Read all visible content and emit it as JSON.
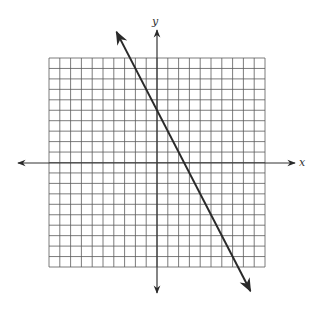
{
  "chart_data": {
    "type": "line",
    "title": "",
    "xlabel": "x",
    "ylabel": "y",
    "xlim": [
      -10,
      10
    ],
    "ylim": [
      -10,
      10
    ],
    "grid": true,
    "grid_step": 1,
    "legend": null,
    "series": [
      {
        "name": "line",
        "equation": "y = -2x + 5",
        "slope": -2,
        "intercept": 5,
        "x": [
          -2.5,
          0,
          2.5,
          7.5
        ],
        "y": [
          10,
          5,
          0,
          -10
        ],
        "arrows": "both"
      }
    ]
  },
  "axes": {
    "x_label": "x",
    "y_label": "y"
  },
  "colors": {
    "grid": "#5a5a5a",
    "axis": "#333333",
    "line": "#2a2a2a"
  }
}
